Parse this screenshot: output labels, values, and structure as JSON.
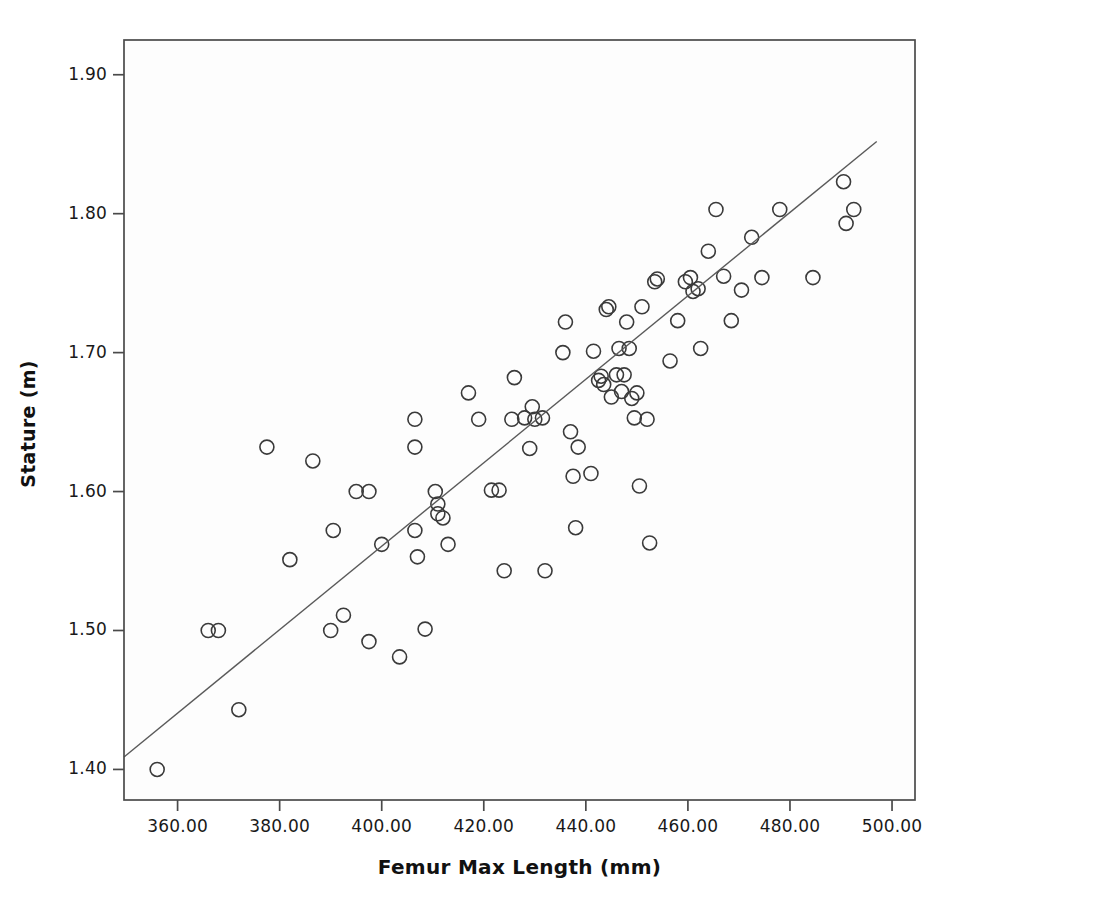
{
  "page": {
    "page_number": "250"
  },
  "annotation": {
    "r2_prefix": "R",
    "r2_exponent": "2",
    "r2_text": " Linear = 0.769"
  },
  "chart_data": {
    "type": "scatter",
    "title": "",
    "xlabel": "Femur Max Length (mm)",
    "ylabel": "Stature (m)",
    "xlim": [
      349.5,
      504.5
    ],
    "ylim": [
      1.378,
      1.925
    ],
    "xticks": [
      360,
      380,
      400,
      420,
      440,
      460,
      480,
      500
    ],
    "xticklabels": [
      "360.00",
      "380.00",
      "400.00",
      "420.00",
      "440.00",
      "460.00",
      "480.00",
      "500.00"
    ],
    "yticks": [
      1.4,
      1.5,
      1.6,
      1.7,
      1.8,
      1.9
    ],
    "yticklabels": [
      "1.40",
      "1.50",
      "1.60",
      "1.70",
      "1.80",
      "1.90"
    ],
    "grid": false,
    "legend": null,
    "marker": {
      "style": "open-circle",
      "radius_px": 7,
      "stroke": "#3a3a3a",
      "stroke_width": 1.6,
      "fill": "none"
    },
    "fit_line": {
      "label": "R2 Linear = 0.769",
      "r_squared": 0.769,
      "color": "#5a5a5a",
      "width": 1.4,
      "x_start": 349.5,
      "y_start": 1.409,
      "x_end": 497.0,
      "y_end": 1.852
    },
    "annotations": [
      {
        "text": "R2 Linear = 0.769",
        "x": 497.0,
        "y": 1.915
      }
    ],
    "points": [
      [
        356.0,
        1.4
      ],
      [
        366.0,
        1.5
      ],
      [
        368.0,
        1.5
      ],
      [
        372.0,
        1.443
      ],
      [
        377.5,
        1.632
      ],
      [
        382.0,
        1.551
      ],
      [
        386.5,
        1.622
      ],
      [
        390.0,
        1.5
      ],
      [
        390.5,
        1.572
      ],
      [
        392.5,
        1.511
      ],
      [
        395.0,
        1.6
      ],
      [
        397.5,
        1.6
      ],
      [
        397.5,
        1.492
      ],
      [
        400.0,
        1.562
      ],
      [
        403.5,
        1.481
      ],
      [
        406.5,
        1.652
      ],
      [
        406.5,
        1.632
      ],
      [
        406.5,
        1.572
      ],
      [
        407.0,
        1.553
      ],
      [
        408.5,
        1.501
      ],
      [
        410.5,
        1.6
      ],
      [
        411.0,
        1.591
      ],
      [
        411.0,
        1.584
      ],
      [
        412.0,
        1.581
      ],
      [
        413.0,
        1.562
      ],
      [
        417.0,
        1.671
      ],
      [
        419.0,
        1.652
      ],
      [
        421.5,
        1.601
      ],
      [
        423.0,
        1.601
      ],
      [
        424.0,
        1.543
      ],
      [
        425.5,
        1.652
      ],
      [
        426.0,
        1.682
      ],
      [
        428.0,
        1.653
      ],
      [
        429.5,
        1.661
      ],
      [
        429.0,
        1.631
      ],
      [
        430.0,
        1.652
      ],
      [
        431.5,
        1.653
      ],
      [
        432.0,
        1.543
      ],
      [
        435.5,
        1.7
      ],
      [
        436.0,
        1.722
      ],
      [
        437.0,
        1.643
      ],
      [
        437.5,
        1.611
      ],
      [
        438.0,
        1.574
      ],
      [
        438.5,
        1.632
      ],
      [
        441.0,
        1.613
      ],
      [
        441.5,
        1.701
      ],
      [
        442.5,
        1.68
      ],
      [
        443.0,
        1.683
      ],
      [
        443.5,
        1.677
      ],
      [
        444.0,
        1.731
      ],
      [
        444.5,
        1.733
      ],
      [
        445.0,
        1.668
      ],
      [
        446.0,
        1.684
      ],
      [
        446.5,
        1.703
      ],
      [
        447.0,
        1.672
      ],
      [
        447.5,
        1.684
      ],
      [
        448.0,
        1.722
      ],
      [
        448.5,
        1.703
      ],
      [
        449.0,
        1.667
      ],
      [
        449.5,
        1.653
      ],
      [
        450.0,
        1.671
      ],
      [
        450.5,
        1.604
      ],
      [
        451.0,
        1.733
      ],
      [
        452.0,
        1.652
      ],
      [
        452.5,
        1.563
      ],
      [
        453.5,
        1.751
      ],
      [
        454.0,
        1.753
      ],
      [
        456.5,
        1.694
      ],
      [
        458.0,
        1.723
      ],
      [
        459.5,
        1.751
      ],
      [
        460.5,
        1.754
      ],
      [
        461.0,
        1.744
      ],
      [
        462.0,
        1.746
      ],
      [
        462.5,
        1.703
      ],
      [
        464.0,
        1.773
      ],
      [
        465.5,
        1.803
      ],
      [
        467.0,
        1.755
      ],
      [
        468.5,
        1.723
      ],
      [
        470.5,
        1.745
      ],
      [
        472.5,
        1.783
      ],
      [
        474.5,
        1.754
      ],
      [
        478.0,
        1.803
      ],
      [
        484.5,
        1.754
      ],
      [
        490.5,
        1.823
      ],
      [
        491.0,
        1.793
      ],
      [
        492.5,
        1.803
      ]
    ]
  }
}
